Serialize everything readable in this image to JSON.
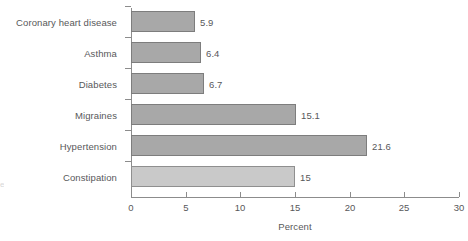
{
  "chart_data": {
    "type": "bar",
    "orientation": "horizontal",
    "title": "",
    "xlabel": "Percent",
    "ylabel": "",
    "xlim": [
      0,
      30
    ],
    "xticks": [
      0,
      5,
      10,
      15,
      20,
      25,
      30
    ],
    "xtick_labels": [
      "0",
      "5",
      "10",
      "15",
      "20",
      "25",
      "30"
    ],
    "grid": false,
    "legend": null,
    "categories": [
      "Coronary heart disease",
      "Asthma",
      "Diabetes",
      "Migraines",
      "Hypertension",
      "Constipation"
    ],
    "values": [
      5.9,
      6.4,
      6.7,
      15.1,
      21.6,
      15
    ],
    "value_labels": [
      "5.9",
      "6.4",
      "6.7",
      "15.1",
      "21.6",
      "15"
    ],
    "bar_colors": [
      "#a8a8a8",
      "#a8a8a8",
      "#a8a8a8",
      "#a8a8a8",
      "#a8a8a8",
      "#c9c9c9"
    ],
    "bars": [
      {
        "category": "Coronary heart disease",
        "value": 5.9,
        "label": "5.9",
        "highlight": false
      },
      {
        "category": "Asthma",
        "value": 6.4,
        "label": "6.4",
        "highlight": false
      },
      {
        "category": "Diabetes",
        "value": 6.7,
        "label": "6.7",
        "highlight": false
      },
      {
        "category": "Migraines",
        "value": 15.1,
        "label": "15.1",
        "highlight": false
      },
      {
        "category": "Hypertension",
        "value": 21.6,
        "label": "21.6",
        "highlight": false
      },
      {
        "category": "Constipation",
        "value": 15,
        "label": "15",
        "highlight": true
      }
    ]
  },
  "colors": {
    "bar_fill": "#a8a8a8",
    "bar_fill_light": "#c9c9c9",
    "bar_border": "#7d7d7d",
    "axis": "#8c8c8c",
    "text": "#58585a",
    "background": "#ffffff"
  },
  "edge_artifact": "e"
}
